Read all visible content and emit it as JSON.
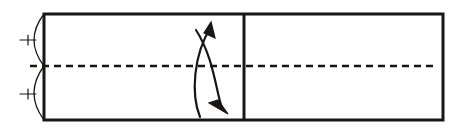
{
  "figure": {
    "title": "Cylindrical shaft end view with rotation arrow",
    "background_color": "#ffffff",
    "line_color": "#1a1613",
    "stroke_weights": {
      "outline": 3.0,
      "divider": 3.0,
      "arc": 1.3,
      "tick": 1.2,
      "centerline": 2.4,
      "arrow": 2.2
    }
  },
  "body_outline": {
    "name": "shaft-body-rectangle",
    "x": 44,
    "y": 14,
    "width": 399,
    "height": 106,
    "fill": "none"
  },
  "divider": {
    "name": "vertical-parting-line",
    "x": 244,
    "y_top": 14,
    "y_bottom": 120
  },
  "centerline": {
    "name": "axis-centerline",
    "y": 66,
    "x_start": 30,
    "x_end": 437,
    "dash_length": 7,
    "gap_length": 5,
    "style": "dashed"
  },
  "end_arcs": [
    {
      "name": "upper-end-arc",
      "start": {
        "x": 44,
        "y": 14
      },
      "end": {
        "x": 44,
        "y": 66
      },
      "bulge_x": 24,
      "bulge_direction": "left"
    },
    {
      "name": "lower-end-arc",
      "start": {
        "x": 44,
        "y": 66
      },
      "end": {
        "x": 44,
        "y": 120
      },
      "bulge_x": 24,
      "bulge_direction": "left"
    }
  ],
  "tick_marks": [
    {
      "name": "upper-cross-tick",
      "cx": 28,
      "cy": 40,
      "half_width": 8,
      "half_height": 5
    },
    {
      "name": "lower-cross-tick",
      "cx": 28,
      "cy": 94,
      "half_width": 8,
      "half_height": 5
    }
  ],
  "rotation_arrow": {
    "name": "rotation-direction-arrow",
    "outer_curve": "M 200 117 C 191 95, 193 55, 211 27",
    "inner_curve": "M 196 30 C 214 58, 216 92, 222 108",
    "head_top": {
      "name": "arrowhead-up",
      "points": "211 22 215 38 204 33"
    },
    "head_bottom": {
      "name": "arrowhead-down-right",
      "points": "228 114 209 103 218 100"
    },
    "direction": "bidirectional",
    "meaning": "rotation about longitudinal axis"
  }
}
